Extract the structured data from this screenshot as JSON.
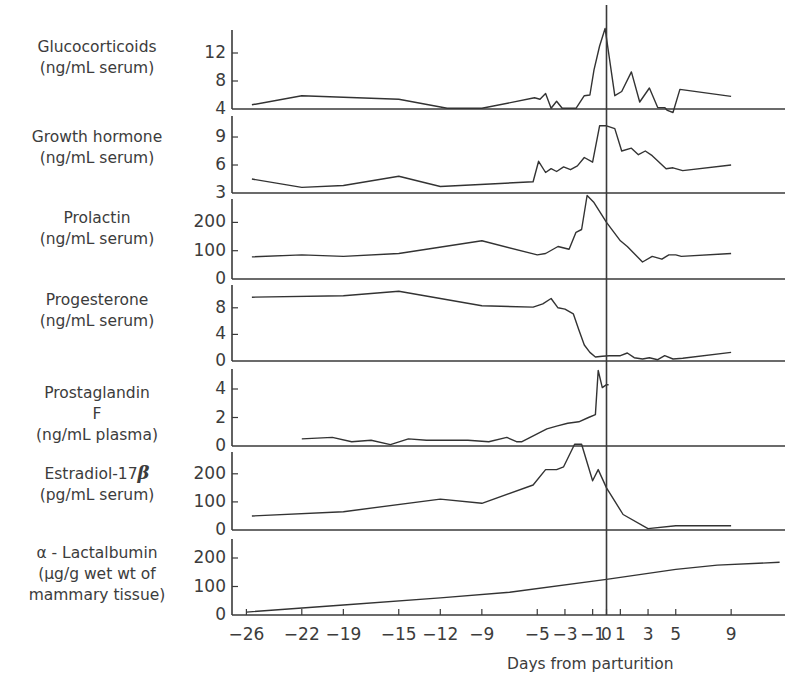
{
  "chart_data": {
    "type": "line",
    "title": "",
    "xlabel": "Days from parturition",
    "x_ticks": [
      -26,
      -22,
      -19,
      -15,
      -12,
      -9,
      -5,
      -3,
      -1,
      0,
      1,
      3,
      5,
      9
    ],
    "x_tick_labels": [
      "−26",
      "−22",
      "−19",
      "−15",
      "−12",
      "−9",
      "−5",
      "−3",
      "−1",
      "0",
      "1",
      "3",
      "5",
      "9"
    ],
    "xlim": [
      -26.5,
      12.8
    ],
    "vertical_reference_line_at": 0,
    "panels": [
      {
        "name": "Glucocorticoids",
        "label_lines": [
          "Glucocorticoids",
          "(ng/mL serum)"
        ],
        "ylim": [
          4,
          15.5
        ],
        "y_ticks": [
          4,
          8,
          12
        ],
        "x": [
          -25.6,
          -22,
          -15,
          -11.5,
          -9,
          -5.2,
          -4.8,
          -4.4,
          -4,
          -3.6,
          -3.2,
          -2.6,
          -2.2,
          -1.6,
          -1.2,
          -0.9,
          -0.5,
          -0.1,
          0.6,
          1.1,
          1.8,
          2.4,
          3.1,
          3.7,
          4.2,
          4.4,
          4.8,
          5.3,
          9
        ],
        "y": [
          4.6,
          5.9,
          5.4,
          4.1,
          4.1,
          5.6,
          5.4,
          6.2,
          4.1,
          5.1,
          4.1,
          4.1,
          4.1,
          5.9,
          6.0,
          9.6,
          13.0,
          15.5,
          5.9,
          6.5,
          9.3,
          5.0,
          7.0,
          4.2,
          4.2,
          3.8,
          3.5,
          6.8,
          5.8
        ]
      },
      {
        "name": "Growth hormone",
        "label_lines": [
          "Growth hormone",
          "(ng/mL serum)"
        ],
        "ylim": [
          3,
          10.5
        ],
        "y_ticks": [
          3,
          6,
          9
        ],
        "x": [
          -25.6,
          -22,
          -19,
          -15,
          -12,
          -5.3,
          -4.9,
          -4.4,
          -4,
          -3.6,
          -3.1,
          -2.6,
          -2.1,
          -1.6,
          -1.0,
          -0.5,
          0,
          0.6,
          1.1,
          1.8,
          2.3,
          2.8,
          3.3,
          4.3,
          4.8,
          5.5,
          9
        ],
        "y": [
          4.5,
          3.6,
          3.8,
          4.8,
          3.7,
          4.2,
          6.4,
          5.2,
          5.6,
          5.3,
          5.8,
          5.5,
          5.9,
          6.8,
          6.3,
          10.2,
          10.2,
          9.9,
          7.5,
          7.8,
          7.1,
          7.5,
          7.0,
          5.6,
          5.7,
          5.4,
          6.0
        ]
      },
      {
        "name": "Prolactin",
        "label_lines": [
          "Prolactin",
          "(ng/mL serum)"
        ],
        "ylim": [
          0,
          270
        ],
        "y_ticks": [
          0,
          100,
          200
        ],
        "x": [
          -25.6,
          -22,
          -19,
          -15,
          -9,
          -5,
          -4.4,
          -3.5,
          -2.7,
          -2.2,
          -1.8,
          -1.4,
          -0.9,
          0,
          1.0,
          1.5,
          2.6,
          3.3,
          4.0,
          4.5,
          5.0,
          5.4,
          9
        ],
        "y": [
          78,
          85,
          80,
          90,
          135,
          85,
          90,
          115,
          105,
          165,
          175,
          295,
          270,
          200,
          135,
          115,
          60,
          80,
          70,
          85,
          85,
          80,
          90
        ]
      },
      {
        "name": "Progesterone",
        "label_lines": [
          "Progesterone",
          "(ng/mL serum)"
        ],
        "ylim": [
          0,
          10.5
        ],
        "y_ticks": [
          0,
          4,
          8
        ],
        "x": [
          -25.6,
          -19,
          -15,
          -9,
          -5.3,
          -4.6,
          -4.0,
          -3.5,
          -3.0,
          -2.4,
          -2.0,
          -1.6,
          -1.2,
          -0.8,
          -0.3,
          0.2,
          1.0,
          1.5,
          2.0,
          2.6,
          3.1,
          3.7,
          4.2,
          4.8,
          5.5,
          9
        ],
        "y": [
          9.6,
          9.8,
          10.5,
          8.3,
          8.1,
          8.6,
          9.4,
          8.0,
          7.8,
          7.1,
          4.7,
          2.4,
          1.3,
          0.6,
          0.7,
          0.8,
          0.8,
          1.2,
          0.5,
          0.3,
          0.5,
          0.2,
          0.8,
          0.3,
          0.4,
          1.3
        ]
      },
      {
        "name": "Prostaglandin F",
        "label_lines": [
          "Prostaglandin",
          "F",
          "(ng/mL plasma)"
        ],
        "ylim": [
          0,
          5.3
        ],
        "y_ticks": [
          0,
          2,
          4
        ],
        "x": [
          -22,
          -19.8,
          -18.4,
          -17,
          -15.6,
          -14.3,
          -13,
          -11.5,
          -10,
          -8.5,
          -7.2,
          -6.5,
          -6.1,
          -5.5,
          -4.9,
          -4.3,
          -3.6,
          -2.8,
          -2.0,
          -1.3,
          -0.8,
          -0.6,
          -0.3,
          0,
          0.15
        ],
        "y": [
          0.5,
          0.6,
          0.3,
          0.4,
          0.1,
          0.5,
          0.4,
          0.4,
          0.4,
          0.3,
          0.6,
          0.3,
          0.3,
          0.6,
          0.9,
          1.2,
          1.4,
          1.6,
          1.7,
          2.0,
          2.2,
          5.3,
          4.1,
          4.3,
          4.3
        ]
      },
      {
        "name": "Estradiol-17β",
        "label_lines": [
          "Estradiol-17",
          "(pg/mL serum)"
        ],
        "label_symbol": "β",
        "ylim": [
          0,
          270
        ],
        "y_ticks": [
          0,
          100,
          200
        ],
        "x": [
          -25.6,
          -19,
          -12,
          -9,
          -5.3,
          -4.4,
          -3.6,
          -3.1,
          -2.3,
          -1.8,
          -1.0,
          -0.6,
          0,
          1.2,
          3.0,
          5.0,
          9
        ],
        "y": [
          50,
          65,
          110,
          95,
          160,
          215,
          215,
          225,
          305,
          305,
          175,
          215,
          150,
          55,
          5,
          15,
          15
        ]
      },
      {
        "name": "α-Lactalbumin",
        "label_lines": [
          "α - Lactalbumin",
          "(μg/g wet wt of",
          "mammary tissue)"
        ],
        "ylim": [
          0,
          270
        ],
        "y_ticks": [
          0,
          100,
          200
        ],
        "x": [
          -26,
          -19,
          -12,
          -7,
          0,
          5,
          8,
          12.5
        ],
        "y": [
          10,
          35,
          60,
          80,
          125,
          160,
          175,
          185
        ]
      }
    ]
  },
  "layout": {
    "x_pixel_day0": 606.5,
    "x_pixel_per_day": 13.85,
    "axis_left_x": 232,
    "axis_right_x": 785,
    "panel_pixels": [
      {
        "y_base": 109,
        "px_per_unit": 7.0,
        "top": 30
      },
      {
        "y_base": 193,
        "px_per_unit": 9.33,
        "top": 116
      },
      {
        "y_base": 279,
        "px_per_unit": 0.283,
        "top": 199
      },
      {
        "y_base": 361,
        "px_per_unit": 6.65,
        "top": 285
      },
      {
        "y_base": 446,
        "px_per_unit": 14.25,
        "top": 369
      },
      {
        "y_base": 530,
        "px_per_unit": 0.281,
        "top": 452
      },
      {
        "y_base": 615,
        "px_per_unit": 0.285,
        "top": 539
      }
    ],
    "vline_top": 5,
    "label_centers_x": 97,
    "label_tops": [
      37,
      127,
      208,
      290,
      383,
      462,
      543
    ]
  }
}
